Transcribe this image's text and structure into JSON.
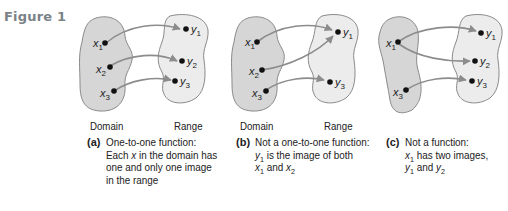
{
  "figure": {
    "label": "Figure 1",
    "colors": {
      "domain_fill": "#d6d6d6",
      "range_fill": "#ececec",
      "outline": "#8a8a8a",
      "arrow": "#8c8c8c",
      "point": "#111111",
      "figure_label": "#7a8287"
    }
  },
  "panels": [
    {
      "id": "a",
      "tag": "(a)",
      "domain_label": "Domain",
      "range_label": "Range",
      "domain_points": [
        "x1",
        "x2",
        "x3"
      ],
      "range_points": [
        "y1",
        "y2",
        "y3"
      ],
      "mappings": [
        [
          "x1",
          "y1"
        ],
        [
          "x2",
          "y2"
        ],
        [
          "x3",
          "y3"
        ]
      ],
      "caption_lines": [
        "One-to-one function:",
        "Each x in the domain has",
        "one and only one image",
        "in the range"
      ],
      "caption": {
        "line1": "One-to-one function:",
        "line2_pre": "Each ",
        "line2_var": "x",
        "line2_post": " in the domain has",
        "line3": "one and only one image",
        "line4": "in the range"
      }
    },
    {
      "id": "b",
      "tag": "(b)",
      "domain_label": "Domain",
      "range_label": "Range",
      "domain_points": [
        "x1",
        "x2",
        "x3"
      ],
      "range_points": [
        "y1",
        "y3"
      ],
      "mappings": [
        [
          "x1",
          "y1"
        ],
        [
          "x2",
          "y1"
        ],
        [
          "x3",
          "y3"
        ]
      ],
      "caption_lines": [
        "Not a one-to-one function:",
        "y1 is the image of both",
        "x1 and x2"
      ],
      "caption": {
        "line1": "Not a one-to-one function:",
        "line2_var": "y",
        "line2_sub": "1",
        "line2_post": " is the image of both",
        "line3_var1": "x",
        "line3_sub1": "1",
        "line3_mid": " and ",
        "line3_var2": "x",
        "line3_sub2": "2"
      }
    },
    {
      "id": "c",
      "tag": "(c)",
      "domain_points": [
        "x1",
        "x3"
      ],
      "range_points": [
        "y1",
        "y2",
        "y3"
      ],
      "mappings": [
        [
          "x1",
          "y1"
        ],
        [
          "x1",
          "y2"
        ],
        [
          "x3",
          "y3"
        ]
      ],
      "caption_lines": [
        "Not a function:",
        "x1 has two images,",
        "y1 and y2"
      ],
      "caption": {
        "line1": "Not a function:",
        "line2_var": "x",
        "line2_sub": "1",
        "line2_post": " has two images,",
        "line3_var1": "y",
        "line3_sub1": "1",
        "line3_mid": " and ",
        "line3_var2": "y",
        "line3_sub2": "2"
      }
    }
  ],
  "point_labels": {
    "x": "x",
    "y": "y",
    "s1": "1",
    "s2": "2",
    "s3": "3"
  }
}
